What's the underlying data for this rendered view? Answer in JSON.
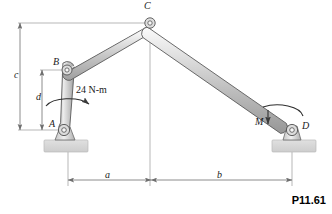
{
  "figure": {
    "number": "P11.61",
    "type": "statics-mechanism-diagram"
  },
  "colors": {
    "bar_fill_light": "#f2f2f2",
    "bar_fill_mid": "#c9c9c9",
    "bar_fill_dark": "#9a9a9a",
    "bar_stroke": "#4d4d4d",
    "ground_fill": "#d6d6d6",
    "ground_stroke": "#b3b3b3",
    "dimension_line": "#808080",
    "text": "#1a1a1a"
  },
  "joints": [
    {
      "name": "C",
      "label": "C",
      "x": 150,
      "y": 23,
      "label_x": 144,
      "label_y": 3
    },
    {
      "name": "B",
      "label": "B",
      "x": 67,
      "y": 70,
      "label_x": 53,
      "label_y": 58
    },
    {
      "name": "A",
      "label": "A",
      "x": 64,
      "y": 130,
      "label_x": 48,
      "label_y": 122
    },
    {
      "name": "D",
      "label": "D",
      "x": 292,
      "y": 130,
      "label_x": 302,
      "label_y": 123
    }
  ],
  "loads": [
    {
      "name": "applied-couple-at-A",
      "label": "24 N-m",
      "value": 24,
      "unit": "N-m",
      "label_x": 76,
      "label_y": 90,
      "sense": "clockwise"
    },
    {
      "name": "couple-at-D",
      "label": "M",
      "label_x": 259,
      "label_y": 122,
      "sense": "clockwise"
    }
  ],
  "dimensions": [
    {
      "name": "dimension-c",
      "label": "c",
      "orientation": "vertical",
      "label_x": 15,
      "label_y": 74,
      "from_y": 23,
      "to_y": 130,
      "axis_x": 20
    },
    {
      "name": "dimension-d",
      "label": "d",
      "orientation": "vertical",
      "label_x": 36,
      "label_y": 96,
      "from_y": 70,
      "to_y": 130,
      "axis_x": 42
    },
    {
      "name": "dimension-a",
      "label": "a",
      "orientation": "horizontal",
      "label_x": 106,
      "label_y": 172,
      "from_x": 68,
      "to_x": 151,
      "axis_y": 180
    },
    {
      "name": "dimension-b",
      "label": "b",
      "orientation": "horizontal",
      "label_x": 218,
      "label_y": 172,
      "from_x": 151,
      "to_x": 292,
      "axis_y": 180
    }
  ],
  "supports": [
    {
      "name": "ground-support-left",
      "x": 44,
      "y": 140,
      "width": 44,
      "height": 12
    },
    {
      "name": "ground-support-right",
      "x": 272,
      "y": 140,
      "width": 44,
      "height": 12
    }
  ]
}
